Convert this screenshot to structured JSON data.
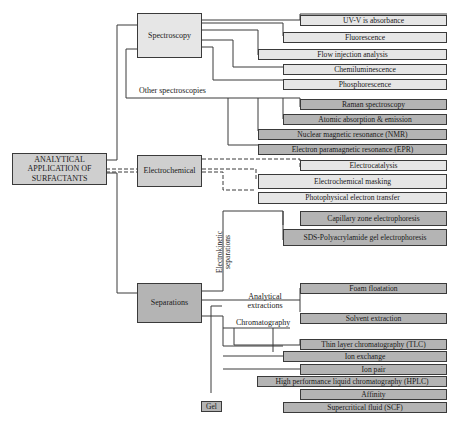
{
  "root": {
    "label": "ANALYTICAL APPLICATION OF SURFACTANTS"
  },
  "categories": {
    "spectroscopy": "Spectroscopy",
    "electrochemical": "Electrochemical",
    "separations": "Separations",
    "gel": "Gel"
  },
  "branch_labels": {
    "other_spectroscopies": "Other spectroscopies",
    "electrokinetic_separations": "Electrokinetic separations",
    "analytical_extractions": "Analytical extractions",
    "chromatography": "Chromatography"
  },
  "spectroscopy_items": [
    "UV-V is absorbance",
    "Fluorescence",
    "Flow injection analysis",
    "Chemiluminescence",
    "Phosphorescence"
  ],
  "other_spectroscopy_items": [
    "Raman spectroscopy",
    "Atomic absorption & emission",
    "Nuclear magnetic resonance (NMR)",
    "Electron paramagnetic resonance (EPR)"
  ],
  "electrochemical_items": [
    "Electrocatalysis",
    "Electrochemical masking",
    "Photophysical electron transfer"
  ],
  "electrokinetic_items": [
    "Capillary zone electrophoresis",
    "SDS-Polyacrylamide gel electrophoresis"
  ],
  "extraction_items": [
    "Foam floatation",
    "Solvent extraction"
  ],
  "chromatography_items": [
    "Thin layer chromatography (TLC)",
    "Ion exchange",
    "Ion pair",
    "High performance liquid chromatography (HPLC)",
    "Affinity",
    "Supercritical fluid (SCF)"
  ],
  "colors": {
    "light_fill": "#e6e6e6",
    "dark_fill": "#b4b4b4",
    "main_fill": "#cfcfcf",
    "line": "#3a3a3a"
  }
}
